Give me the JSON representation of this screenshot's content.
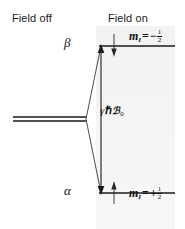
{
  "figure": {
    "type": "energy-level-diagram",
    "headers": {
      "left": "Field off",
      "right": "Field on"
    },
    "levels": [
      {
        "id": "beta",
        "state_label": "β",
        "quantum_number_symbol": "m",
        "quantum_number_subscript": "I",
        "equals": "=",
        "sign": "−",
        "numerator": "1",
        "denominator": "2",
        "magnetic_moment_arrow": "down",
        "position": "upper"
      },
      {
        "id": "alpha",
        "state_label": "α",
        "quantum_number_symbol": "m",
        "quantum_number_subscript": "I",
        "equals": "=",
        "sign": "+",
        "numerator": "1",
        "denominator": "2",
        "magnetic_moment_arrow": "up",
        "position": "lower"
      }
    ],
    "energy_gap": {
      "gamma": "γ",
      "hbar": "ℏ",
      "field_symbol": "ℬ",
      "field_subscript": "0"
    },
    "colors": {
      "line": "#1a1a1a",
      "text": "#111111",
      "shaded_panel": "#f4f4f4",
      "background": "#ffffff"
    }
  }
}
